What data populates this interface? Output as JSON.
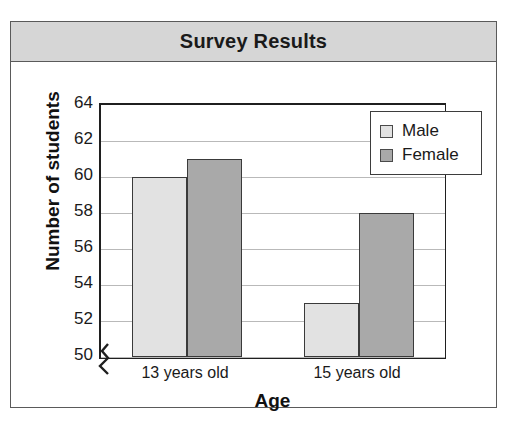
{
  "card": {
    "title": "Survey Results"
  },
  "chart_data": {
    "type": "bar",
    "title": "Survey Results",
    "xlabel": "Age",
    "ylabel": "Number of students",
    "categories": [
      "13 years old",
      "15 years old"
    ],
    "series": [
      {
        "name": "Male",
        "values": [
          60,
          53
        ],
        "color": "#e2e2e2"
      },
      {
        "name": "Female",
        "values": [
          61,
          58
        ],
        "color": "#a9a9a9"
      }
    ],
    "ylim": [
      50,
      64
    ],
    "ytick_step": 2,
    "yticks": [
      64,
      62,
      60,
      58,
      56,
      54,
      52,
      50
    ],
    "ytick_labels": [
      "64",
      "62",
      "60",
      "58",
      "56",
      "54",
      "52",
      "50"
    ],
    "gridlines": [
      62,
      60,
      58,
      56,
      54,
      52,
      50
    ],
    "grid": true,
    "axis_break": true,
    "legend_position": "top-right",
    "legend_entries": [
      "Male",
      "Female"
    ]
  },
  "legend": {
    "male_label": "Male",
    "female_label": "Female"
  },
  "axes": {
    "y_title": "Number of students",
    "x_title": "Age",
    "x_labels": [
      "13 years old",
      "15 years old"
    ]
  }
}
